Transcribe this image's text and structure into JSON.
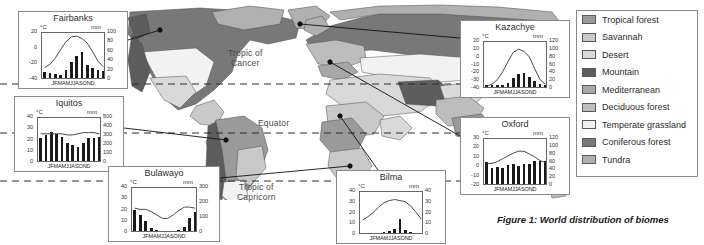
{
  "figure": {
    "caption": "Figure 1: World distribution of biomes"
  },
  "map": {
    "latitude_labels": [
      {
        "text": "Tropic of\nCancer",
        "x": 228,
        "y": 52
      },
      {
        "text": "Equator",
        "x": 258,
        "y": 122
      },
      {
        "text": "Tropic of\nCapricorn",
        "x": 237,
        "y": 185
      }
    ],
    "ocean_color": "#ffffff",
    "outline_color": "#4d4d4d"
  },
  "legend": {
    "title": "",
    "items": [
      {
        "label": "Tropical forest",
        "color": "#9a9a9a"
      },
      {
        "label": "Savannah",
        "color": "#c9c9c9"
      },
      {
        "label": "Desert",
        "color": "#d9d9d9"
      },
      {
        "label": "Mountain",
        "color": "#5d5d5d"
      },
      {
        "label": "Mediterranean",
        "color": "#a8a8a8"
      },
      {
        "label": "Deciduous forest",
        "color": "#bdbdbd"
      },
      {
        "label": "Temperate grassland",
        "color": "#f2f2f2"
      },
      {
        "label": "Coniferous forest",
        "color": "#787878"
      },
      {
        "label": "Tundra",
        "color": "#b0b0b0"
      }
    ]
  },
  "months": "JFMAMJJASOND",
  "units": {
    "temperature": "°C",
    "precipitation": "mm"
  },
  "chart_data": [
    {
      "type": "bar",
      "title": "Fairbanks",
      "id": "fairbanks",
      "box": {
        "x": 18,
        "y": 11,
        "w": 110,
        "h": 78
      },
      "categories": [
        "J",
        "F",
        "M",
        "A",
        "M",
        "J",
        "J",
        "A",
        "S",
        "O",
        "N",
        "D"
      ],
      "values": [
        13,
        10,
        8,
        6,
        16,
        35,
        47,
        55,
        28,
        22,
        16,
        15
      ],
      "series": [
        {
          "name": "Temperature",
          "values": [
            -24,
            -20,
            -12,
            -1,
            9,
            15,
            16,
            13,
            7,
            -4,
            -16,
            -23
          ]
        }
      ],
      "ylabel": "°C",
      "ylabel2": "mm",
      "ylim": [
        -40,
        20
      ],
      "ylim2": [
        0,
        100
      ],
      "yticks": [
        20,
        0,
        -20,
        -40
      ],
      "yticks2": [
        100,
        80,
        60,
        40,
        20,
        0
      ],
      "grid": false,
      "legend": "none"
    },
    {
      "type": "bar",
      "title": "Iquitos",
      "id": "iquitos",
      "box": {
        "x": 14,
        "y": 96,
        "w": 110,
        "h": 76
      },
      "categories": [
        "J",
        "F",
        "M",
        "A",
        "M",
        "J",
        "J",
        "A",
        "S",
        "O",
        "N",
        "D"
      ],
      "values": [
        260,
        290,
        320,
        300,
        270,
        200,
        180,
        160,
        200,
        260,
        260,
        270
      ],
      "series": [
        {
          "name": "Temperature",
          "values": [
            26,
            26,
            26,
            26,
            26,
            25,
            25,
            26,
            27,
            27,
            27,
            26
          ]
        }
      ],
      "ylabel": "°C",
      "ylabel2": "mm",
      "ylim": [
        0,
        40
      ],
      "ylim2": [
        0,
        500
      ],
      "yticks": [
        40,
        30,
        20,
        10,
        0
      ],
      "yticks2": [
        500,
        400,
        300,
        200,
        100,
        0
      ],
      "grid": false,
      "legend": "none"
    },
    {
      "type": "bar",
      "title": "Bulawayo",
      "id": "bulawayo",
      "box": {
        "x": 108,
        "y": 166,
        "w": 112,
        "h": 76
      },
      "categories": [
        "J",
        "F",
        "M",
        "A",
        "M",
        "J",
        "J",
        "A",
        "S",
        "O",
        "N",
        "D"
      ],
      "values": [
        140,
        110,
        70,
        20,
        8,
        3,
        2,
        2,
        5,
        25,
        85,
        130
      ],
      "series": [
        {
          "name": "Temperature",
          "values": [
            22,
            21,
            21,
            19,
            16,
            13,
            13,
            16,
            20,
            23,
            23,
            22
          ]
        }
      ],
      "ylabel": "°C",
      "ylabel2": "mm",
      "ylim": [
        0,
        40
      ],
      "ylim2": [
        0,
        300
      ],
      "yticks": [
        40,
        30,
        20,
        10,
        0
      ],
      "yticks2": [
        300,
        200,
        100,
        0
      ],
      "grid": false,
      "legend": "none"
    },
    {
      "type": "bar",
      "title": "Bilma",
      "id": "bilma",
      "box": {
        "x": 336,
        "y": 170,
        "w": 110,
        "h": 74
      },
      "categories": [
        "J",
        "F",
        "M",
        "A",
        "M",
        "J",
        "J",
        "A",
        "S",
        "O",
        "N",
        "D"
      ],
      "values": [
        0,
        0,
        0,
        0,
        1,
        2,
        4,
        13,
        3,
        1,
        0,
        0
      ],
      "series": [
        {
          "name": "Temperature",
          "values": [
            14,
            17,
            21,
            26,
            30,
            32,
            33,
            32,
            31,
            27,
            21,
            15
          ]
        }
      ],
      "ylabel": "°C",
      "ylabel2": "mm",
      "ylim": [
        0,
        40
      ],
      "ylim2": [
        0,
        40
      ],
      "yticks": [
        40,
        30,
        20,
        10,
        0
      ],
      "yticks2": [
        40,
        30,
        20,
        10,
        0
      ],
      "grid": false,
      "legend": "none"
    },
    {
      "type": "bar",
      "title": "Kazachye",
      "id": "kazachye",
      "box": {
        "x": 460,
        "y": 20,
        "w": 110,
        "h": 78
      },
      "categories": [
        "J",
        "F",
        "M",
        "A",
        "M",
        "J",
        "J",
        "A",
        "S",
        "O",
        "N",
        "D"
      ],
      "values": [
        6,
        5,
        5,
        6,
        10,
        22,
        32,
        37,
        25,
        15,
        8,
        6
      ],
      "series": [
        {
          "name": "Temperature",
          "values": [
            -36,
            -34,
            -28,
            -18,
            -5,
            7,
            11,
            8,
            1,
            -14,
            -28,
            -34
          ]
        }
      ],
      "ylabel": "°C",
      "ylabel2": "mm",
      "ylim": [
        -40,
        20
      ],
      "ylim2": [
        0,
        120
      ],
      "yticks": [
        20,
        10,
        0,
        -10,
        -20,
        -30,
        -40
      ],
      "yticks2": [
        120,
        100,
        80,
        60,
        40,
        20,
        0
      ],
      "grid": false,
      "legend": "none"
    },
    {
      "type": "bar",
      "title": "Oxford",
      "id": "oxford",
      "box": {
        "x": 460,
        "y": 117,
        "w": 110,
        "h": 78
      },
      "categories": [
        "J",
        "F",
        "M",
        "A",
        "M",
        "J",
        "J",
        "A",
        "S",
        "O",
        "N",
        "D"
      ],
      "values": [
        56,
        42,
        44,
        42,
        48,
        50,
        46,
        52,
        50,
        58,
        60,
        58
      ],
      "series": [
        {
          "name": "Temperature",
          "values": [
            4,
            4,
            6,
            9,
            12,
            15,
            17,
            17,
            14,
            11,
            7,
            5
          ]
        }
      ],
      "ylabel": "°C",
      "ylabel2": "mm",
      "ylim": [
        -20,
        30
      ],
      "ylim2": [
        0,
        120
      ],
      "yticks": [
        30,
        20,
        10,
        0,
        -10,
        -20
      ],
      "yticks2": [
        120,
        100,
        80,
        60,
        40,
        20,
        0
      ],
      "grid": false,
      "legend": "none"
    }
  ]
}
